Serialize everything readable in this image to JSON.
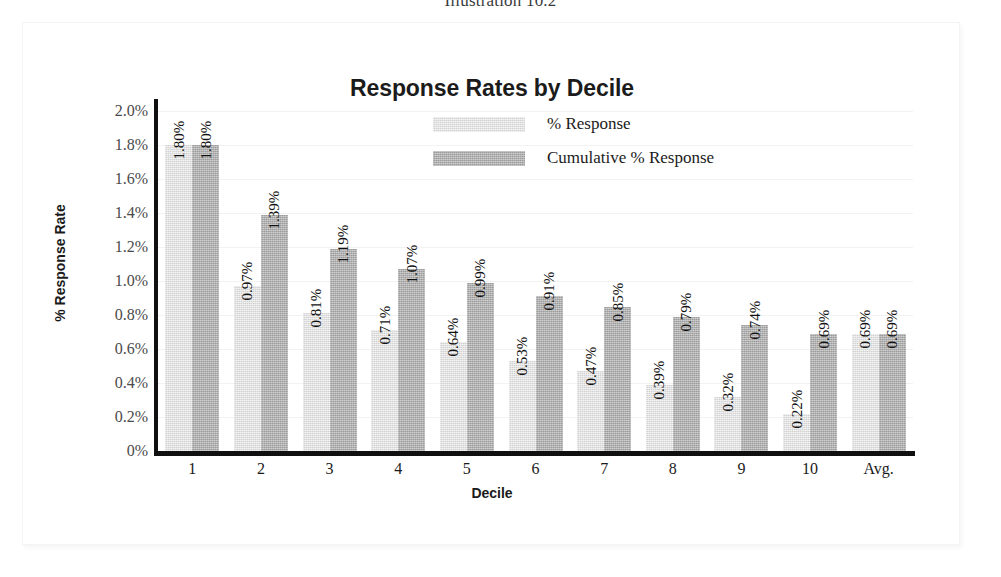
{
  "figure": {
    "caption": "Illustration 10.2",
    "frame_color": "#f4f4f4",
    "background": "#ffffff"
  },
  "chart_data": {
    "type": "bar",
    "title": "Response Rates by Decile",
    "xlabel": "Decile",
    "ylabel": "% Response Rate",
    "categories": [
      "1",
      "2",
      "3",
      "4",
      "5",
      "6",
      "7",
      "8",
      "9",
      "10",
      "Avg."
    ],
    "series": [
      {
        "name": "% Response",
        "color": "#d2d2d2",
        "values": [
          1.8,
          0.97,
          0.81,
          0.71,
          0.64,
          0.53,
          0.47,
          0.39,
          0.32,
          0.22,
          0.69
        ],
        "labels": [
          "1.80%",
          "0.97%",
          "0.81%",
          "0.71%",
          "0.64%",
          "0.53%",
          "0.47%",
          "0.39%",
          "0.32%",
          "0.22%",
          "0.69%"
        ]
      },
      {
        "name": "Cumulative % Response",
        "color": "#9b9b9b",
        "values": [
          1.8,
          1.39,
          1.19,
          1.07,
          0.99,
          0.91,
          0.85,
          0.79,
          0.74,
          0.69,
          0.69
        ],
        "labels": [
          "1.80%",
          "1.39%",
          "1.19%",
          "1.07%",
          "0.99%",
          "0.91%",
          "0.85%",
          "0.79%",
          "0.74%",
          "0.69%",
          "0.69%"
        ]
      }
    ],
    "ylim": [
      0,
      2.06
    ],
    "ytick_values": [
      2.0,
      1.8,
      1.6,
      1.4,
      1.2,
      1.0,
      0.8,
      0.6,
      0.4,
      0.2,
      0
    ],
    "ytick_labels": [
      "2.0%",
      "1.8%",
      "1.6%",
      "1.4%",
      "1.2%",
      "1.0%",
      "0.8%",
      "0.6%",
      "0.4%",
      "0.2%",
      "0%"
    ],
    "grid": true,
    "legend_position": "top-center-inside",
    "axis_color": "#101010"
  }
}
